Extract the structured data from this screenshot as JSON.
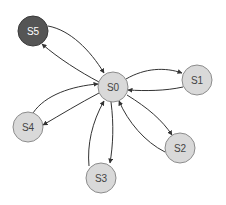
{
  "diagram": {
    "type": "state-transition-graph",
    "colors": {
      "node_fill": "#d9d9d9",
      "node_stroke": "#8c8c8c",
      "highlight_fill": "#555555",
      "highlight_stroke": "#3a3a3a",
      "label": "#444444",
      "highlight_label": "#ffffff",
      "edge": "#333333"
    },
    "nodes": [
      {
        "id": "S0",
        "label": "S0",
        "cx": 113,
        "cy": 87,
        "highlighted": false
      },
      {
        "id": "S1",
        "label": "S1",
        "cx": 197,
        "cy": 80,
        "highlighted": false
      },
      {
        "id": "S2",
        "label": "S2",
        "cx": 180,
        "cy": 148,
        "highlighted": false
      },
      {
        "id": "S3",
        "label": "S3",
        "cx": 101,
        "cy": 178,
        "highlighted": false
      },
      {
        "id": "S4",
        "label": "S4",
        "cx": 28,
        "cy": 127,
        "highlighted": false
      },
      {
        "id": "S5",
        "label": "S5",
        "cx": 33,
        "cy": 31,
        "highlighted": true
      }
    ],
    "edges": [
      {
        "from": "S0",
        "to": "S1"
      },
      {
        "from": "S1",
        "to": "S0"
      },
      {
        "from": "S0",
        "to": "S2"
      },
      {
        "from": "S2",
        "to": "S0"
      },
      {
        "from": "S0",
        "to": "S3"
      },
      {
        "from": "S3",
        "to": "S0"
      },
      {
        "from": "S0",
        "to": "S4"
      },
      {
        "from": "S4",
        "to": "S0"
      },
      {
        "from": "S0",
        "to": "S5"
      },
      {
        "from": "S5",
        "to": "S0"
      }
    ]
  }
}
